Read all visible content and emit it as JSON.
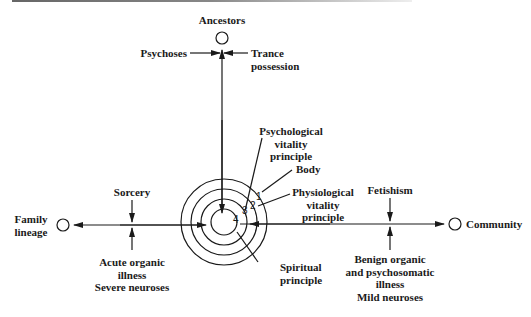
{
  "diagram": {
    "poles": {
      "top": "Ancestors",
      "left": [
        "Family",
        "lineage"
      ],
      "right": "Community"
    },
    "vertical_axis": {
      "left_arrow_label": "Psychoses",
      "right_arrow_label": [
        "Trance",
        "possession"
      ]
    },
    "left_axis": {
      "top_arrow_label": "Sorcery",
      "bottom_arrow_label": [
        "Acute organic",
        "illness",
        "Severe neuroses"
      ]
    },
    "right_axis": {
      "top_arrow_label": "Fetishism",
      "bottom_arrow_label": [
        "Benign organic",
        "and psychosomatic",
        "illness",
        "Mild neuroses"
      ]
    },
    "rings": [
      {
        "number": "1",
        "label": "Body"
      },
      {
        "number": "2",
        "label": [
          "Physiological",
          "vitality",
          "principle"
        ]
      },
      {
        "number": "3",
        "label": [
          "Psychological",
          "vitality",
          "principle"
        ]
      },
      {
        "number": "4",
        "label": [
          "Spiritual",
          "principle"
        ]
      }
    ]
  }
}
